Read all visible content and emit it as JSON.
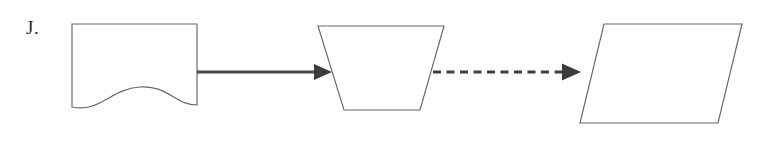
{
  "figure": {
    "label": "J.",
    "background_color": "#ffffff",
    "width": 766,
    "height": 143,
    "shape_stroke_color": "#666666",
    "connector_color": "#4a4a4a",
    "arrowhead_color": "#3b3b3b",
    "label_color": "#2b2b2b",
    "nodes": [
      {
        "id": "node-document",
        "shape": "document",
        "description": "rectangle with wavy bottom edge",
        "fill": "#ffffff",
        "stroke": "#666666",
        "geometry": {
          "left": 72,
          "right": 197,
          "top": 24,
          "bottom": 105,
          "wave_dip": 13
        }
      },
      {
        "id": "node-trapezoid",
        "shape": "trapezoid-inverted",
        "description": "trapezoid wider at top than bottom",
        "fill": "#ffffff",
        "stroke": "#666666",
        "geometry": {
          "top_left": 318,
          "top_right": 444,
          "bottom_left": 344,
          "bottom_right": 420,
          "top": 26,
          "bottom": 110
        }
      },
      {
        "id": "node-parallelogram",
        "shape": "parallelogram",
        "description": "parallelogram slanted to the right",
        "fill": "#ffffff",
        "stroke": "#666666",
        "geometry": {
          "top_left": 604,
          "top_right": 742,
          "bottom_left": 580,
          "bottom_right": 718,
          "top": 24,
          "bottom": 123
        }
      }
    ],
    "connectors": [
      {
        "id": "connector-solid",
        "style": "solid",
        "from": "node-document",
        "to": "node-trapezoid",
        "color": "#4a4a4a",
        "geometry": {
          "x1": 196,
          "x2": 318,
          "y": 72
        },
        "arrowhead": "filled-triangle"
      },
      {
        "id": "connector-dashed",
        "style": "dashed",
        "from": "node-trapezoid",
        "to": "node-parallelogram",
        "color": "#3f3f3f",
        "dash_pattern": "8 5.5",
        "geometry": {
          "x1": 433,
          "x2": 568,
          "y": 72
        },
        "arrowhead": "filled-triangle"
      }
    ]
  }
}
